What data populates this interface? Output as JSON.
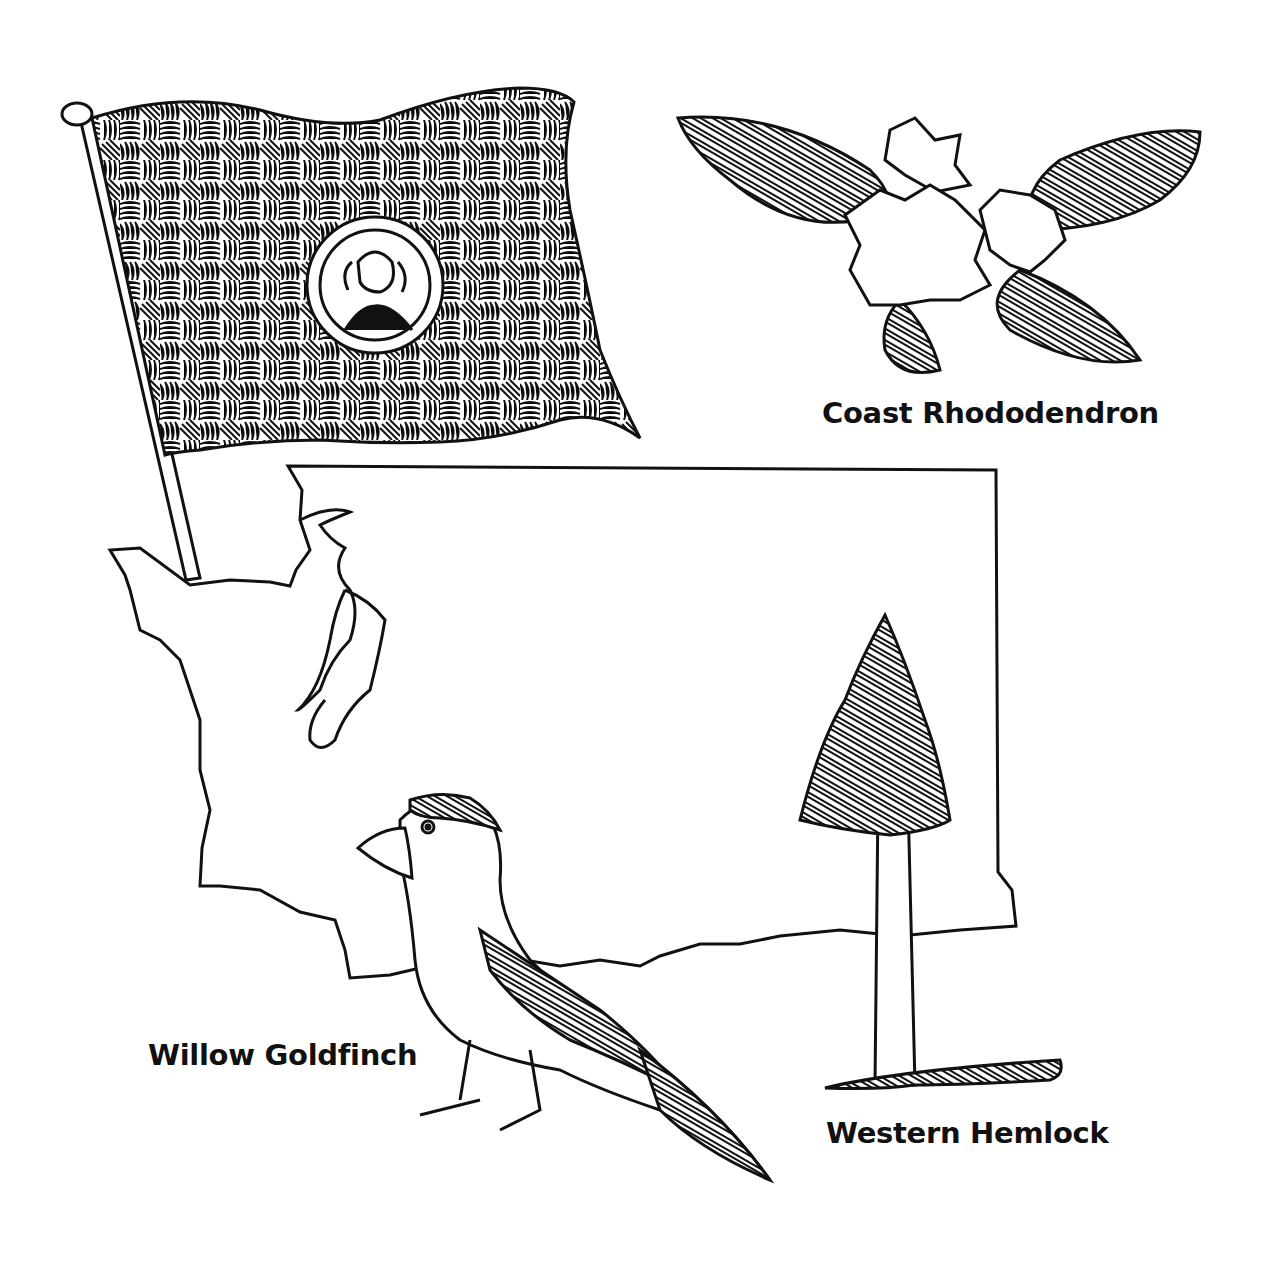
{
  "illustration": {
    "subject": "Washington state symbols coloring page",
    "colors": {
      "ink": "#111111",
      "paper": "#ffffff"
    },
    "elements": [
      {
        "name": "state-flag",
        "description": "Waving hatched flag on pole with portrait seal"
      },
      {
        "name": "state-map",
        "description": "Outline of Washington state"
      },
      {
        "name": "flower",
        "description": "Rhododendron blossoms with leaves"
      },
      {
        "name": "bird",
        "description": "Goldfinch perched"
      },
      {
        "name": "tree",
        "description": "Hemlock tree"
      }
    ]
  },
  "labels": {
    "flower": "Coast Rhododendron",
    "bird": "Willow Goldfinch",
    "tree": "Western Hemlock"
  }
}
